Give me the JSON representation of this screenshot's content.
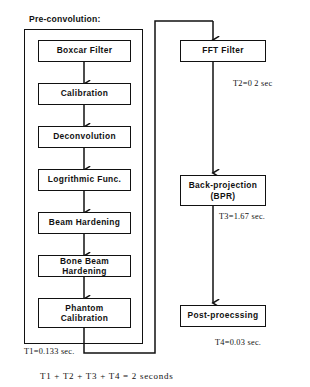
{
  "diagram": {
    "group_caption": "Pre-convolution:",
    "stroke_color": "#111111",
    "background_color": "#ffffff",
    "left_column": [
      {
        "id": "boxcar-filter",
        "label": "Boxcar Filter"
      },
      {
        "id": "calibration",
        "label": "Calibration"
      },
      {
        "id": "deconvolution",
        "label": "Deconvolution"
      },
      {
        "id": "logrithmic-func",
        "label": "Logrithmic Func."
      },
      {
        "id": "beam-hardening",
        "label": "Beam Hardening"
      },
      {
        "id": "bone-beam-hardening",
        "label": "Bone Beam\nHardening"
      },
      {
        "id": "phantom-calibration",
        "label": "Phantom\nCalibration"
      }
    ],
    "right_column": [
      {
        "id": "fft-filter",
        "label": "FFT Filter"
      },
      {
        "id": "back-projection",
        "label": "Back-projection\n(BPR)"
      },
      {
        "id": "post-processing",
        "label": "Post-proecssing"
      }
    ],
    "timing_labels": [
      {
        "id": "t1",
        "text": "T1=0.133 sec."
      },
      {
        "id": "t2",
        "text": "T2=0 2 sec"
      },
      {
        "id": "t3",
        "text": "T3=1.67 sec."
      },
      {
        "id": "t4",
        "text": "T4=0.03 sec."
      }
    ],
    "total_time": "T1 + T2 + T3 + T4 = 2 seconds"
  }
}
